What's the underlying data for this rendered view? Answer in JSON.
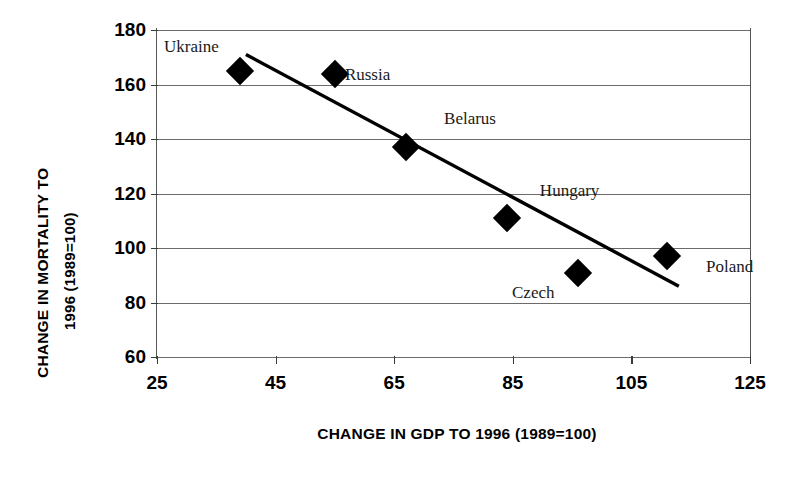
{
  "chart_data": {
    "type": "scatter",
    "title": "",
    "xlabel": "CHANGE IN GDP TO 1996 (1989=100)",
    "ylabel_line1": "CHANGE IN MORTALITY TO",
    "ylabel_line2": "1996 (1989=100)",
    "xlim": [
      25,
      125
    ],
    "ylim": [
      60,
      180
    ],
    "xticks": [
      25,
      45,
      65,
      85,
      105,
      125
    ],
    "yticks": [
      60,
      80,
      100,
      120,
      140,
      160,
      180
    ],
    "grid": true,
    "legend": "none",
    "marker_shape": "diamond",
    "marker_color": "#000000",
    "points": [
      {
        "label": "Ukraine",
        "x": 39,
        "y": 165,
        "label_dx": -76,
        "label_dy": -34
      },
      {
        "label": "Russia",
        "x": 55,
        "y": 164,
        "label_dx": 10,
        "label_dy": -9
      },
      {
        "label": "Belarus",
        "x": 67,
        "y": 137,
        "label_dx": 38,
        "label_dy": -38
      },
      {
        "label": "Hungary",
        "x": 84,
        "y": 111,
        "label_dx": 33,
        "label_dy": -37
      },
      {
        "label": "Czech",
        "x": 96,
        "y": 91,
        "label_dx": -66,
        "label_dy": 10
      },
      {
        "label": "Poland",
        "x": 111,
        "y": 97,
        "label_dx": 39,
        "label_dy": 1
      }
    ],
    "trendline": {
      "type": "linear-fit",
      "x_start": 40,
      "y_start": 171,
      "x_end": 113,
      "y_end": 86,
      "color": "#000000",
      "width": 3.4
    }
  }
}
